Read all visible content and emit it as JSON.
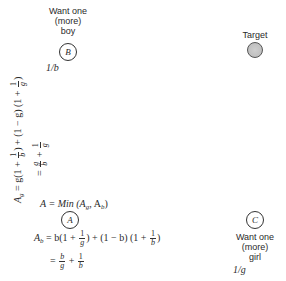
{
  "nodes": {
    "B": {
      "letter": "B",
      "label_line1": "Want one",
      "label_line2": "(more)",
      "label_line3": "boy",
      "value": "1/b"
    },
    "target": {
      "label": "Target"
    },
    "A": {
      "letter": "A",
      "definition": "A = Min (A",
      "def_sub_g": "g",
      "def_mid": ", A",
      "def_sub_b": "b",
      "def_end": ")"
    },
    "C": {
      "letter": "C",
      "label_line1": "Want one",
      "label_line2": "(more)",
      "label_line3": "girl",
      "value": "1/g"
    }
  },
  "equations": {
    "Ag": {
      "lhs": "A",
      "lhs_sub": "g",
      "part1": " = g(1 + ",
      "frac1_num": "1",
      "frac1_den": "b",
      "part2": ") + (1 − g) (1 + ",
      "frac2_num": "1",
      "frac2_den": "g",
      "part3": ")",
      "simplified_prefix": "= ",
      "sfrac1_num": "g",
      "sfrac1_den": "b",
      "plus": " + ",
      "sfrac2_num": "1",
      "sfrac2_den": "g"
    },
    "Ab": {
      "lhs": "A",
      "lhs_sub": "b",
      "part1": " = b(1 + ",
      "frac1_num": "1",
      "frac1_den": "g",
      "part2": ") + (1 − b) (1 + ",
      "frac2_num": "1",
      "frac2_den": "b",
      "part3": ")",
      "simplified_prefix": "= ",
      "sfrac1_num": "b",
      "sfrac1_den": "g",
      "plus": " + ",
      "sfrac2_num": "1",
      "sfrac2_den": "b"
    }
  }
}
